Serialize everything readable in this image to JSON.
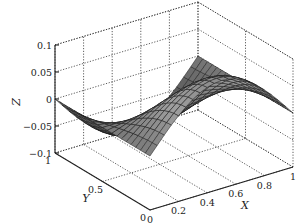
{
  "chart_data": {
    "type": "surface3d",
    "title": "",
    "xlabel": "X",
    "ylabel": "Y",
    "zlabel": "Z",
    "xlim": [
      0,
      1
    ],
    "ylim": [
      0,
      1
    ],
    "zlim": [
      -0.1,
      0.1
    ],
    "xticks": [
      "0",
      "0.2",
      "0.4",
      "0.6",
      "0.8",
      "1"
    ],
    "yticks": [
      "0",
      "0.5",
      "1"
    ],
    "zticks": [
      "-0.1",
      "-0.05",
      "0",
      "0.05",
      "0.1"
    ],
    "grid": true,
    "colormap": "gray",
    "surface_description": "Mesh surface z = 0.1*sin(pi*x)*cos(pi*y) over unit square; peaks at 0.1 along Y=0, dips to -0.1 along Y=1",
    "grid_resolution": 20
  },
  "labels": {
    "x": "X",
    "y": "Y",
    "z": "Z"
  },
  "colors": {
    "background": "#ffffff",
    "axis": "#222222",
    "grid": "#333333",
    "mesh_line": "#1a1a1a"
  }
}
